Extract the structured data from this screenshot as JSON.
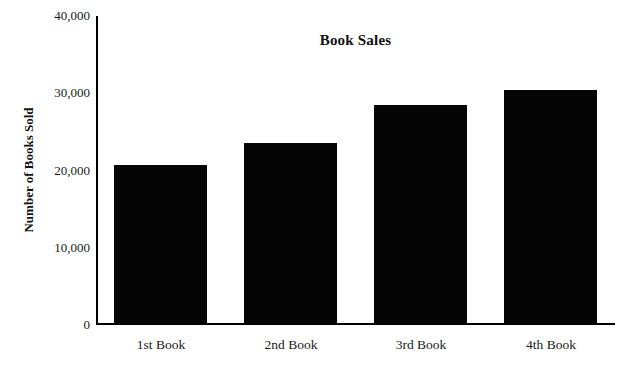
{
  "chart_data": {
    "type": "bar",
    "title": "Book Sales",
    "xlabel": "",
    "ylabel": "Number of Books Sold",
    "categories": [
      "1st Book",
      "2nd Book",
      "3rd Book",
      "4th Book"
    ],
    "values": [
      20500,
      23300,
      28200,
      30200
    ],
    "ylim": [
      0,
      40000
    ],
    "ytick_values": [
      0,
      10000,
      20000,
      30000,
      40000
    ],
    "ytick_labels": [
      "0",
      "10,000",
      "20,000",
      "30,000",
      "40,000"
    ],
    "grid": false,
    "legend": false,
    "legend_position": "none",
    "bar_color": "#050505",
    "axis_color": "#000000",
    "background_color": "#ffffff"
  }
}
